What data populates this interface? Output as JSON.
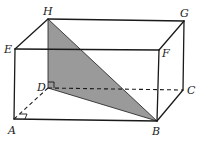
{
  "diagram": {
    "type": "rectangular-prism",
    "vertices": {
      "A": {
        "label": "A",
        "x": 14,
        "y": 119
      },
      "B": {
        "label": "B",
        "x": 157,
        "y": 121
      },
      "C": {
        "label": "C",
        "x": 183,
        "y": 90
      },
      "D": {
        "label": "D",
        "x": 48,
        "y": 88
      },
      "E": {
        "label": "E",
        "x": 15,
        "y": 49
      },
      "F": {
        "label": "F",
        "x": 159,
        "y": 50
      },
      "G": {
        "label": "G",
        "x": 184,
        "y": 21
      },
      "H": {
        "label": "H",
        "x": 48,
        "y": 19
      }
    },
    "visible_edges": [
      "EF",
      "FG",
      "GH",
      "HE",
      "AB",
      "BC",
      "CG",
      "BF",
      "AE"
    ],
    "hidden_edges": [
      "AD",
      "DC",
      "DH"
    ],
    "shaded_triangle": [
      "H",
      "D",
      "B"
    ],
    "shade_color": "#9a9a9a",
    "right_angles": [
      "A",
      "D"
    ]
  }
}
